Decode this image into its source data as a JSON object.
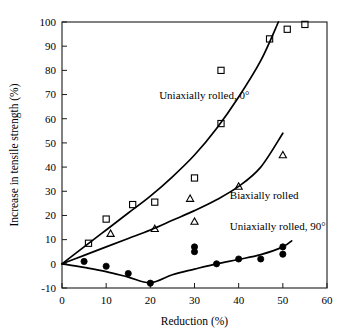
{
  "chart_data": {
    "type": "scatter",
    "title": "",
    "xlabel": "Reduction (%)",
    "ylabel": "Increase in tensile strength (%)",
    "xlim": [
      0,
      60
    ],
    "ylim": [
      -10,
      100
    ],
    "xticks": [
      0,
      10,
      20,
      30,
      40,
      50,
      60
    ],
    "yticks": [
      -10,
      0,
      10,
      20,
      30,
      40,
      50,
      60,
      70,
      80,
      90,
      100
    ],
    "xtick_labels": [
      "0",
      "10",
      "20",
      "30",
      "40",
      "50",
      "60"
    ],
    "ytick_labels": [
      "-10",
      "0",
      "10",
      "20",
      "30",
      "40",
      "50",
      "60",
      "70",
      "80",
      "90",
      "100"
    ],
    "grid": false,
    "legend": "inline-annotations",
    "series": [
      {
        "name": "Uniaxially rolled, 0°",
        "marker": "open-square",
        "annotation": "Uniaxially rolled, 0°",
        "annotation_x": 22,
        "annotation_y": 68,
        "points": [
          {
            "x": 6,
            "y": 8.5
          },
          {
            "x": 10,
            "y": 18.5
          },
          {
            "x": 16,
            "y": 24.5
          },
          {
            "x": 21,
            "y": 25.5
          },
          {
            "x": 30,
            "y": 35.5
          },
          {
            "x": 36,
            "y": 80
          },
          {
            "x": 36,
            "y": 58
          },
          {
            "x": 47,
            "y": 93
          },
          {
            "x": 51,
            "y": 97
          },
          {
            "x": 55,
            "y": 99
          }
        ],
        "fit_curve": [
          {
            "x": 0,
            "y": 0
          },
          {
            "x": 5,
            "y": 7
          },
          {
            "x": 10,
            "y": 14
          },
          {
            "x": 15,
            "y": 21
          },
          {
            "x": 20,
            "y": 28
          },
          {
            "x": 25,
            "y": 36
          },
          {
            "x": 30,
            "y": 45
          },
          {
            "x": 35,
            "y": 56
          },
          {
            "x": 40,
            "y": 69
          },
          {
            "x": 45,
            "y": 84
          },
          {
            "x": 49,
            "y": 100
          }
        ]
      },
      {
        "name": "Biaxially rolled",
        "marker": "open-triangle",
        "annotation": "Biaxially rolled",
        "annotation_x": 38,
        "annotation_y": 27,
        "points": [
          {
            "x": 11,
            "y": 12.5
          },
          {
            "x": 21,
            "y": 14.5
          },
          {
            "x": 29,
            "y": 27
          },
          {
            "x": 30,
            "y": 17.5
          },
          {
            "x": 40,
            "y": 32
          },
          {
            "x": 50,
            "y": 45
          }
        ],
        "fit_curve": [
          {
            "x": 0,
            "y": 0
          },
          {
            "x": 5,
            "y": 3.5
          },
          {
            "x": 10,
            "y": 7
          },
          {
            "x": 15,
            "y": 10.5
          },
          {
            "x": 20,
            "y": 14
          },
          {
            "x": 25,
            "y": 18
          },
          {
            "x": 30,
            "y": 22
          },
          {
            "x": 35,
            "y": 26.5
          },
          {
            "x": 40,
            "y": 32
          },
          {
            "x": 45,
            "y": 40
          },
          {
            "x": 50,
            "y": 54
          }
        ]
      },
      {
        "name": "Uniaxially rolled, 90°",
        "marker": "filled-circle",
        "annotation": "Uniaxially rolled, 90°",
        "annotation_x": 38,
        "annotation_y": 14,
        "points": [
          {
            "x": 5,
            "y": 1
          },
          {
            "x": 10,
            "y": -1
          },
          {
            "x": 15,
            "y": -4
          },
          {
            "x": 20,
            "y": -8
          },
          {
            "x": 30,
            "y": 7
          },
          {
            "x": 30,
            "y": 5
          },
          {
            "x": 35,
            "y": 0
          },
          {
            "x": 40,
            "y": 2
          },
          {
            "x": 45,
            "y": 2
          },
          {
            "x": 50,
            "y": 7
          },
          {
            "x": 50,
            "y": 4
          }
        ],
        "fit_curve": [
          {
            "x": 0,
            "y": 0
          },
          {
            "x": 5,
            "y": -1.5
          },
          {
            "x": 10,
            "y": -3.2
          },
          {
            "x": 15,
            "y": -5.5
          },
          {
            "x": 20,
            "y": -7.8
          },
          {
            "x": 25,
            "y": -4.5
          },
          {
            "x": 30,
            "y": -2.2
          },
          {
            "x": 35,
            "y": 0
          },
          {
            "x": 40,
            "y": 1.8
          },
          {
            "x": 45,
            "y": 3.8
          },
          {
            "x": 50,
            "y": 7
          },
          {
            "x": 52,
            "y": 9.5
          }
        ]
      }
    ]
  }
}
